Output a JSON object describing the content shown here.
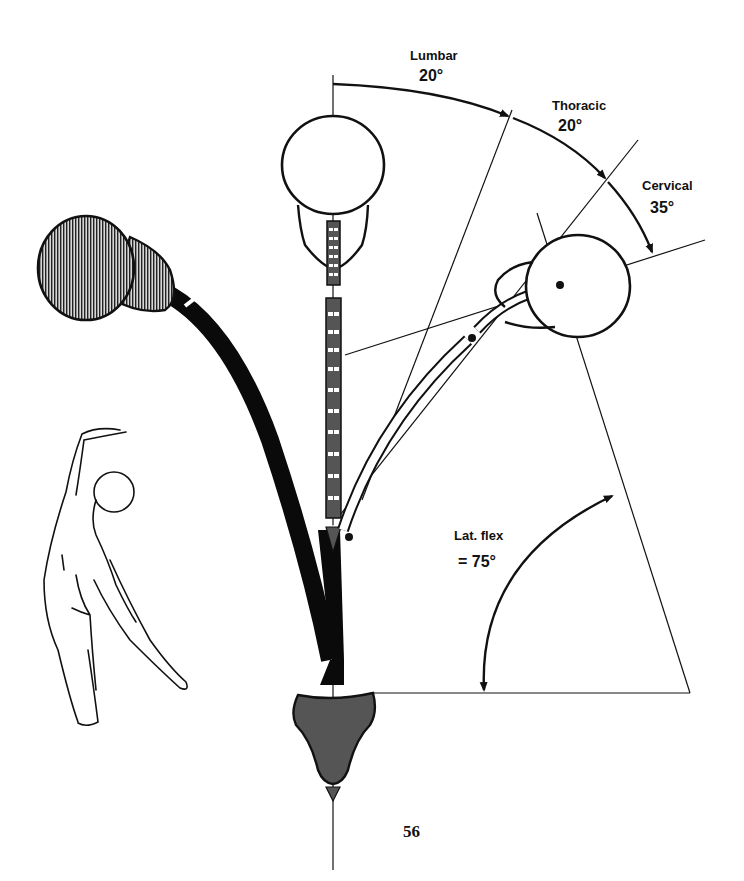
{
  "labels": {
    "lumbar": {
      "name": "Lumbar",
      "degrees": "20°"
    },
    "thoracic": {
      "name": "Thoracic",
      "degrees": "20°"
    },
    "cervical": {
      "name": "Cervical",
      "degrees": "35°"
    },
    "total": {
      "name": "Lat. flex",
      "degrees": "= 75°"
    }
  },
  "page_number": "56",
  "colors": {
    "ink": "#111111",
    "vertebra_fill": "#555555",
    "pelvis_fill": "#555555",
    "hatched_head": "#8a8a8a",
    "background": "#ffffff"
  }
}
